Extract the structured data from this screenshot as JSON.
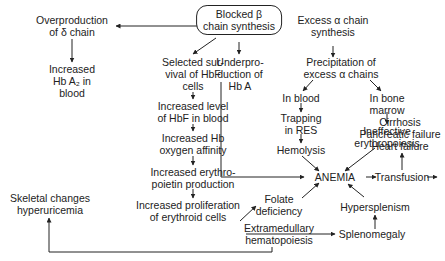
{
  "diagram": {
    "colors": {
      "line": "#222222",
      "text": "#222222",
      "background": "#ffffff"
    },
    "nodes": {
      "blocked_beta": [
        "Blocked β",
        "chain synthesis"
      ],
      "overproduction_delta": [
        "Overproduction",
        "of δ chain"
      ],
      "increased_hba2": [
        "Increased",
        "Hb A₂ in",
        "blood"
      ],
      "excess_alpha": [
        "Excess α chain",
        "synthesis"
      ],
      "selected_survival": [
        "Selected sur-",
        "vival of HbF",
        "cells"
      ],
      "underproduction_hba": [
        "Underpro-",
        "duction of",
        "Hb A"
      ],
      "precipitation_alpha": [
        "Precipitation of",
        "excess α chains"
      ],
      "in_blood": [
        "In blood"
      ],
      "in_bone_marrow": [
        "In bone",
        "marrow"
      ],
      "trapping_res": [
        "Trapping",
        "in RES"
      ],
      "hemolysis": [
        "Hemolysis"
      ],
      "ineffective_erythropoiesis": [
        "Ineffective",
        "erythropoiesis"
      ],
      "increased_hbf": [
        "Increased level",
        "of HbF in blood"
      ],
      "increased_affinity": [
        "Increased Hb",
        "oxygen affinity"
      ],
      "increased_epo": [
        "Increased erythro-",
        "poietin production"
      ],
      "increased_proliferation": [
        "Increased proliferation",
        "of erythroid cells"
      ],
      "skeletal_changes": [
        "Skeletal changes",
        "hyperuricemia"
      ],
      "folate_deficiency": [
        "Folate",
        "deficiency"
      ],
      "extramedullary": [
        "Extramedullary",
        "hematopoiesis"
      ],
      "anemia": [
        "ANEMIA"
      ],
      "transfusion": [
        "Transfusion"
      ],
      "iron_overload": [
        "Iron overload"
      ],
      "complications": [
        "Cirrhosis",
        "Pancreatic failure",
        "Heart failure"
      ],
      "hypersplenism": [
        "Hypersplenism"
      ],
      "splenomegaly": [
        "Splenomegaly"
      ]
    },
    "edges": [
      [
        "blocked_beta",
        "overproduction_delta"
      ],
      [
        "blocked_beta",
        "excess_alpha"
      ],
      [
        "blocked_beta",
        "selected_survival"
      ],
      [
        "blocked_beta",
        "underproduction_hba"
      ],
      [
        "overproduction_delta",
        "increased_hba2"
      ],
      [
        "excess_alpha",
        "precipitation_alpha"
      ],
      [
        "precipitation_alpha",
        "in_blood"
      ],
      [
        "precipitation_alpha",
        "in_bone_marrow"
      ],
      [
        "in_blood",
        "trapping_res"
      ],
      [
        "trapping_res",
        "hemolysis"
      ],
      [
        "in_bone_marrow",
        "ineffective_erythropoiesis"
      ],
      [
        "hemolysis",
        "anemia"
      ],
      [
        "ineffective_erythropoiesis",
        "anemia"
      ],
      [
        "underproduction_hba",
        "anemia"
      ],
      [
        "selected_survival",
        "increased_hbf"
      ],
      [
        "increased_hbf",
        "increased_affinity"
      ],
      [
        "increased_affinity",
        "increased_epo"
      ],
      [
        "increased_epo",
        "increased_proliferation"
      ],
      [
        "increased_proliferation",
        "folate_deficiency"
      ],
      [
        "folate_deficiency",
        "anemia"
      ],
      [
        "increased_proliferation",
        "splenomegaly"
      ],
      [
        "extramedullary",
        "skeletal_changes"
      ],
      [
        "splenomegaly",
        "hypersplenism"
      ],
      [
        "hypersplenism",
        "anemia"
      ],
      [
        "anemia",
        "transfusion"
      ],
      [
        "transfusion",
        "iron_overload"
      ],
      [
        "iron_overload",
        "complications"
      ]
    ]
  }
}
